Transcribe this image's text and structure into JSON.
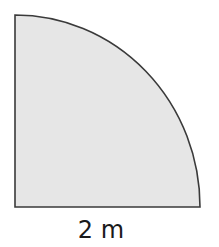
{
  "diagram": {
    "shape": "quarter-circle",
    "fill_color": "#e6e6e6",
    "stroke_color": "#3a3a3a",
    "radius_label": "2 m"
  }
}
